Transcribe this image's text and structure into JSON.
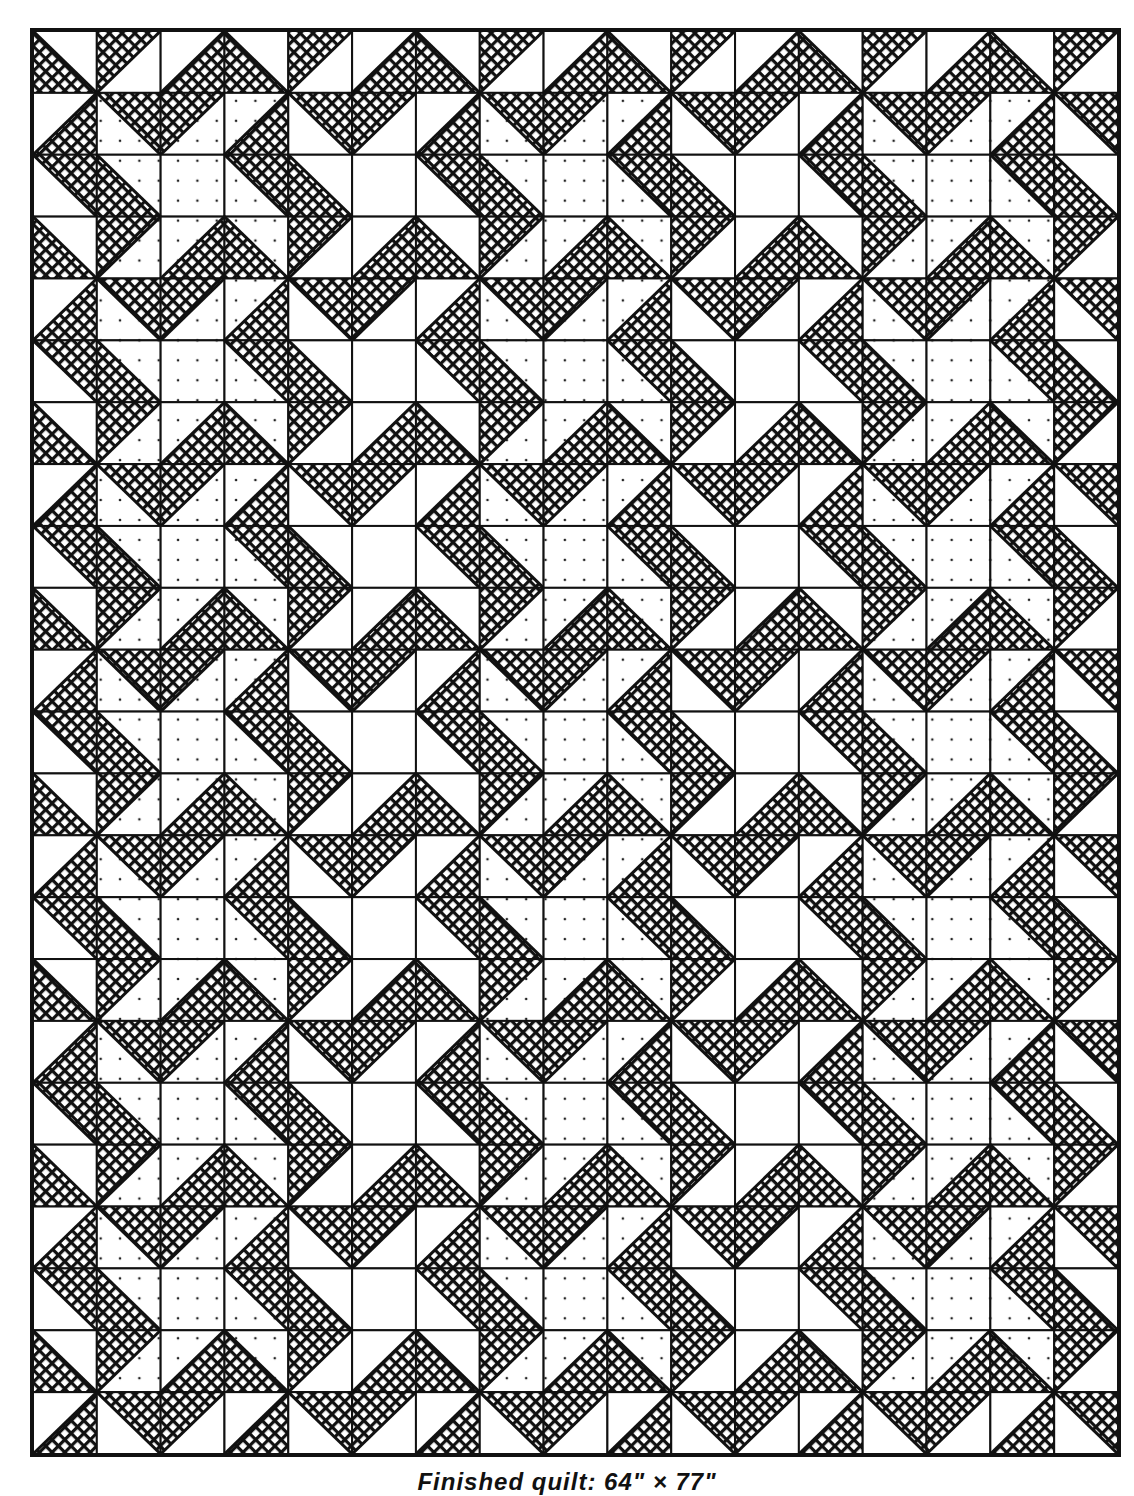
{
  "figure": {
    "type": "quilt-layout-diagram",
    "caption": "Finished quilt: 64\" × 77\"",
    "grid": {
      "columns": 17,
      "rows": 23
    },
    "fabrics": {
      "crosshatch": {
        "name": "dark crosshatch print",
        "color": "#111111"
      },
      "dotted": {
        "name": "light dotted print",
        "color": "#ffffff",
        "dot_color": "#222222"
      },
      "plain": {
        "name": "white",
        "color": "#ffffff"
      }
    },
    "legend_codes": {
      "BL": "half-square triangle, crosshatch in lower-left",
      "TL": "half-square triangle, crosshatch in upper-left",
      "BR": "half-square triangle, crosshatch in lower-right",
      "TR": "half-square triangle, crosshatch in upper-right",
      "--": "plain square, no triangle",
      "suffix W": "other half white",
      "suffix D": "other half dotted"
    },
    "cells": [
      [
        "BL-W",
        "TL-W",
        "BR-W",
        "BL-W",
        "TL-W",
        "BR-W",
        "BL-W",
        "TL-W",
        "BR-W",
        "BL-W",
        "TL-W",
        "BR-W",
        "BL-W",
        "TL-W",
        "BR-W",
        "BL-W",
        "TL-W"
      ],
      [
        "BR-W",
        "TR-D",
        "TL-D",
        "BR-D",
        "TR-W",
        "TL-W",
        "BR-W",
        "TR-D",
        "TL-D",
        "BR-D",
        "TR-W",
        "TL-W",
        "BR-W",
        "TR-D",
        "TL-D",
        "BR-D",
        "TR-W"
      ],
      [
        "TR-W",
        "BL-D",
        "---D",
        "TR-D",
        "BL-W",
        "---W",
        "TR-W",
        "BL-D",
        "---D",
        "TR-D",
        "BL-W",
        "---W",
        "TR-W",
        "BL-D",
        "---D",
        "TR-D",
        "BL-W"
      ],
      [
        "BL-W",
        "TL-D",
        "BR-D",
        "BL-D",
        "TL-W",
        "BR-W",
        "BL-W",
        "TL-D",
        "BR-D",
        "BL-D",
        "TL-W",
        "BR-W",
        "BL-W",
        "TL-D",
        "BR-D",
        "BL-D",
        "TL-W"
      ],
      [
        "BR-W",
        "TR-D",
        "TL-D",
        "BR-D",
        "TR-W",
        "TL-W",
        "BR-W",
        "TR-D",
        "TL-D",
        "BR-D",
        "TR-W",
        "TL-W",
        "BR-W",
        "TR-D",
        "TL-D",
        "BR-D",
        "TR-W"
      ],
      [
        "TR-W",
        "BL-D",
        "---D",
        "TR-D",
        "BL-W",
        "---W",
        "TR-W",
        "BL-D",
        "---D",
        "TR-D",
        "BL-W",
        "---W",
        "TR-W",
        "BL-D",
        "---D",
        "TR-D",
        "BL-W"
      ],
      [
        "BL-W",
        "TL-D",
        "BR-D",
        "BL-D",
        "TL-W",
        "BR-W",
        "BL-W",
        "TL-D",
        "BR-D",
        "BL-D",
        "TL-W",
        "BR-W",
        "BL-W",
        "TL-D",
        "BR-D",
        "BL-D",
        "TL-W"
      ],
      [
        "BR-W",
        "TR-D",
        "TL-D",
        "BR-D",
        "TR-W",
        "TL-W",
        "BR-W",
        "TR-D",
        "TL-D",
        "BR-D",
        "TR-W",
        "TL-W",
        "BR-W",
        "TR-D",
        "TL-D",
        "BR-D",
        "TR-W"
      ],
      [
        "TR-W",
        "BL-D",
        "---D",
        "TR-D",
        "BL-W",
        "---W",
        "TR-W",
        "BL-D",
        "---D",
        "TR-D",
        "BL-W",
        "---W",
        "TR-W",
        "BL-D",
        "---D",
        "TR-D",
        "BL-W"
      ],
      [
        "BL-W",
        "TL-D",
        "BR-D",
        "BL-D",
        "TL-W",
        "BR-W",
        "BL-W",
        "TL-D",
        "BR-D",
        "BL-D",
        "TL-W",
        "BR-W",
        "BL-W",
        "TL-D",
        "BR-D",
        "BL-D",
        "TL-W"
      ],
      [
        "BR-W",
        "TR-D",
        "TL-D",
        "BR-D",
        "TR-W",
        "TL-W",
        "BR-W",
        "TR-D",
        "TL-D",
        "BR-D",
        "TR-W",
        "TL-W",
        "BR-W",
        "TR-D",
        "TL-D",
        "BR-D",
        "TR-W"
      ],
      [
        "TR-W",
        "BL-D",
        "---D",
        "TR-D",
        "BL-W",
        "---W",
        "TR-W",
        "BL-D",
        "---D",
        "TR-D",
        "BL-W",
        "---W",
        "TR-W",
        "BL-D",
        "---D",
        "TR-D",
        "BL-W"
      ],
      [
        "BL-W",
        "TL-D",
        "BR-D",
        "BL-D",
        "TL-W",
        "BR-W",
        "BL-W",
        "TL-D",
        "BR-D",
        "BL-D",
        "TL-W",
        "BR-W",
        "BL-W",
        "TL-D",
        "BR-D",
        "BL-D",
        "TL-W"
      ],
      [
        "BR-W",
        "TR-D",
        "TL-D",
        "BR-D",
        "TR-W",
        "TL-W",
        "BR-W",
        "TR-D",
        "TL-D",
        "BR-D",
        "TR-W",
        "TL-W",
        "BR-W",
        "TR-D",
        "TL-D",
        "BR-D",
        "TR-W"
      ],
      [
        "TR-W",
        "BL-D",
        "---D",
        "TR-D",
        "BL-W",
        "---W",
        "TR-W",
        "BL-D",
        "---D",
        "TR-D",
        "BL-W",
        "---W",
        "TR-W",
        "BL-D",
        "---D",
        "TR-D",
        "BL-W"
      ],
      [
        "BL-W",
        "TL-D",
        "BR-D",
        "BL-D",
        "TL-W",
        "BR-W",
        "BL-W",
        "TL-D",
        "BR-D",
        "BL-D",
        "TL-W",
        "BR-W",
        "BL-W",
        "TL-D",
        "BR-D",
        "BL-D",
        "TL-W"
      ],
      [
        "BR-W",
        "TR-D",
        "TL-D",
        "BR-D",
        "TR-W",
        "TL-W",
        "BR-W",
        "TR-D",
        "TL-D",
        "BR-D",
        "TR-W",
        "TL-W",
        "BR-W",
        "TR-D",
        "TL-D",
        "BR-D",
        "TR-W"
      ],
      [
        "TR-W",
        "BL-D",
        "---D",
        "TR-D",
        "BL-W",
        "---W",
        "TR-W",
        "BL-D",
        "---D",
        "TR-D",
        "BL-W",
        "---W",
        "TR-W",
        "BL-D",
        "---D",
        "TR-D",
        "BL-W"
      ],
      [
        "BL-W",
        "TL-D",
        "BR-D",
        "BL-D",
        "TL-W",
        "BR-W",
        "BL-W",
        "TL-D",
        "BR-D",
        "BL-D",
        "TL-W",
        "BR-W",
        "BL-W",
        "TL-D",
        "BR-D",
        "BL-D",
        "TL-W"
      ],
      [
        "BR-W",
        "TR-D",
        "TL-D",
        "BR-D",
        "TR-W",
        "TL-W",
        "BR-W",
        "TR-D",
        "TL-D",
        "BR-D",
        "TR-W",
        "TL-W",
        "BR-W",
        "TR-D",
        "TL-D",
        "BR-D",
        "TR-W"
      ],
      [
        "TR-W",
        "BL-D",
        "---D",
        "TR-D",
        "BL-W",
        "---W",
        "TR-W",
        "BL-D",
        "---D",
        "TR-D",
        "BL-W",
        "---W",
        "TR-W",
        "BL-D",
        "---D",
        "TR-D",
        "BL-W"
      ],
      [
        "BL-W",
        "TL-D",
        "BR-D",
        "BL-D",
        "TL-W",
        "BR-W",
        "BL-W",
        "TL-D",
        "BR-D",
        "BL-D",
        "TL-W",
        "BR-W",
        "BL-W",
        "TL-D",
        "BR-D",
        "BL-D",
        "TL-W"
      ],
      [
        "BR-W",
        "TR-W",
        "TL-W",
        "BR-W",
        "TR-W",
        "TL-W",
        "BR-W",
        "TR-W",
        "TL-W",
        "BR-W",
        "TR-W",
        "TL-W",
        "BR-W",
        "TR-W",
        "TL-W",
        "BR-W",
        "TR-W"
      ]
    ]
  }
}
